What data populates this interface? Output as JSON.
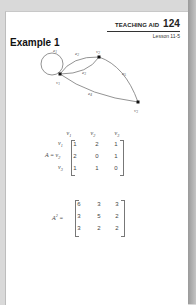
{
  "header": {
    "teaching_aid_label": "TEACHING AID",
    "teaching_aid_number": "124",
    "lesson": "Lesson 11-5"
  },
  "example": {
    "title": "Example 1"
  },
  "graph": {
    "vertices": [
      {
        "name": "v1",
        "label": "v1",
        "x": 60,
        "y": 74
      },
      {
        "name": "v2",
        "label": "v2",
        "x": 99,
        "y": 57
      },
      {
        "name": "v3",
        "label": "v3",
        "x": 138,
        "y": 102
      }
    ],
    "edges": [
      {
        "name": "e1",
        "from": "v1",
        "to": "v1",
        "type": "loop"
      },
      {
        "name": "e2",
        "from": "v1",
        "to": "v2"
      },
      {
        "name": "e3",
        "from": "v1",
        "to": "v2"
      },
      {
        "name": "e4",
        "from": "v1",
        "to": "v3"
      },
      {
        "name": "e5",
        "from": "v2",
        "to": "v3"
      }
    ]
  },
  "adjacency_matrix": {
    "name": "A",
    "column_headers": [
      "v1",
      "v2",
      "v3"
    ],
    "row_headers": [
      "v1",
      "v2",
      "v3"
    ],
    "rows": [
      [
        "1",
        "2",
        "1"
      ],
      [
        "2",
        "0",
        "1"
      ],
      [
        "1",
        "1",
        "0"
      ]
    ]
  },
  "squared_matrix": {
    "name": "A",
    "exponent": "2",
    "rows": [
      [
        "6",
        "3",
        "3"
      ],
      [
        "3",
        "5",
        "2"
      ],
      [
        "3",
        "2",
        "2"
      ]
    ]
  }
}
